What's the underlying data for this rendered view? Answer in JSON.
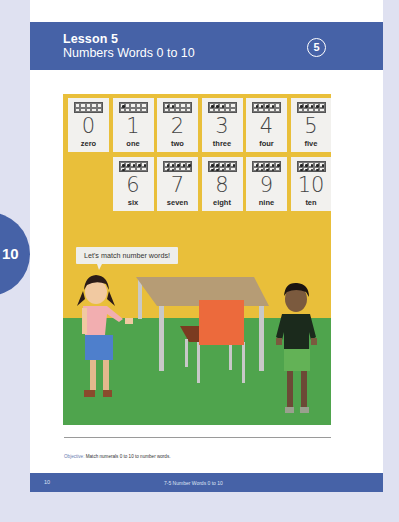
{
  "header": {
    "lesson_label": "Lesson 5",
    "lesson_title": "Numbers Words 0 to 10",
    "badge_number": "5",
    "color": "#4662a7"
  },
  "side_tab": {
    "label": "10"
  },
  "illustration": {
    "cards": [
      {
        "numeral": "0",
        "word": "zero",
        "dots": 0
      },
      {
        "numeral": "1",
        "word": "one",
        "dots": 1
      },
      {
        "numeral": "2",
        "word": "two",
        "dots": 2
      },
      {
        "numeral": "3",
        "word": "three",
        "dots": 3
      },
      {
        "numeral": "4",
        "word": "four",
        "dots": 4
      },
      {
        "numeral": "5",
        "word": "five",
        "dots": 5
      },
      {
        "numeral": "6",
        "word": "six",
        "dots": 6
      },
      {
        "numeral": "7",
        "word": "seven",
        "dots": 7
      },
      {
        "numeral": "8",
        "word": "eight",
        "dots": 8
      },
      {
        "numeral": "9",
        "word": "nine",
        "dots": 9
      },
      {
        "numeral": "10",
        "word": "ten",
        "dots": 10
      }
    ],
    "speech_bubble": "Let's match number words!",
    "wall_color": "#e9bf3a",
    "floor_color": "#4fa44d"
  },
  "objective": {
    "label": "Objective:",
    "text": "Match numerals 0 to 10 to number words."
  },
  "footer": {
    "page_number": "10",
    "title": "7-5  Number Words 0 to 10"
  }
}
